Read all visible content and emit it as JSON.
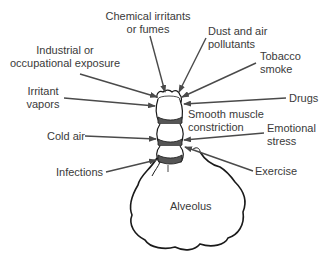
{
  "diagram": {
    "type": "annotated-illustration",
    "center_label": "Alveolus",
    "structure_label": [
      "Smooth muscle",
      "constriction"
    ],
    "triggers": [
      {
        "id": "chemical",
        "lines": [
          "Chemical irritants",
          "or fumes"
        ]
      },
      {
        "id": "dust",
        "lines": [
          "Dust and air",
          "pollutants"
        ]
      },
      {
        "id": "industrial",
        "lines": [
          "Industrial or",
          "occupational exposure"
        ]
      },
      {
        "id": "tobacco",
        "lines": [
          "Tobacco",
          "smoke"
        ]
      },
      {
        "id": "irritant",
        "lines": [
          "Irritant",
          "vapors"
        ]
      },
      {
        "id": "drugs",
        "lines": [
          "Drugs"
        ]
      },
      {
        "id": "cold",
        "lines": [
          "Cold air"
        ]
      },
      {
        "id": "emotional",
        "lines": [
          "Emotional",
          "stress"
        ]
      },
      {
        "id": "infections",
        "lines": [
          "Infections"
        ]
      },
      {
        "id": "exercise",
        "lines": [
          "Exercise"
        ]
      }
    ],
    "colors": {
      "text": "#3a3a3a",
      "arrow": "#4a4a4a",
      "outline": "#1a1a1a",
      "muscle_band": "#555555",
      "background": "#ffffff"
    }
  }
}
